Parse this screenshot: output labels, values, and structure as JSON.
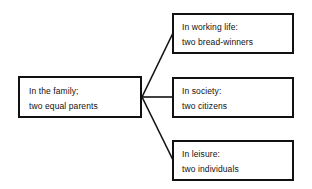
{
  "diagram": {
    "type": "tree",
    "root": {
      "id": "family",
      "title": "In the family;",
      "subtitle": "two equal parents"
    },
    "branches": [
      {
        "id": "working",
        "title": "In working life:",
        "subtitle": "two bread-winners"
      },
      {
        "id": "society",
        "title": "In society:",
        "subtitle": "two citizens"
      },
      {
        "id": "leisure",
        "title": "In leisure:",
        "subtitle": "two individuals"
      }
    ],
    "colors": {
      "line": "#111111",
      "background": "#ffffff"
    }
  }
}
